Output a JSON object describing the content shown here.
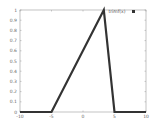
{
  "chart_data": {
    "type": "line",
    "title": "",
    "xlabel": "",
    "ylabel": "",
    "xlim": [
      -10,
      10
    ],
    "ylim": [
      0,
      1
    ],
    "grid": false,
    "legend_position": "top-right",
    "x_ticks": [
      "-10",
      "-5",
      "0",
      "5",
      "10"
    ],
    "y_ticks": [
      "0",
      "0.1",
      "0.2",
      "0.3",
      "0.4",
      "0.5",
      "0.6",
      "0.7",
      "0.8",
      "0.9",
      "1"
    ],
    "series": [
      {
        "name": "trimf(x)",
        "color": "#333333",
        "x": [
          -10,
          -5,
          3.3,
          5,
          10
        ],
        "y": [
          0,
          0,
          1,
          0,
          0
        ]
      }
    ]
  },
  "legend": {
    "label": "trimf(x)",
    "marker_color": "#333333"
  },
  "colors": {
    "line": "#333333",
    "frame": "#999999",
    "background": "#ffffff"
  }
}
